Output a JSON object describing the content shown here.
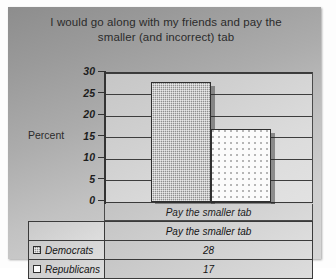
{
  "chart_data": {
    "type": "bar",
    "title": "I would go along with my friends and pay the smaller (and incorrect) tab",
    "title_line1": "I would go along with my friends and pay the",
    "title_line2": "smaller (and incorrect) tab",
    "xlabel": "",
    "ylabel": "Percent",
    "categories": [
      "Pay the smaller tab"
    ],
    "series": [
      {
        "name": "Democrats",
        "values": [
          28
        ],
        "swatch": "dem"
      },
      {
        "name": "Republicans",
        "values": [
          17
        ],
        "swatch": "rep"
      }
    ],
    "ylim": [
      0,
      30
    ],
    "yticks": [
      0,
      5,
      10,
      15,
      20,
      25,
      30
    ],
    "ytick_labels": [
      "0",
      "5",
      "10",
      "15",
      "20",
      "25",
      "30"
    ],
    "grid": true,
    "legend_position": "bottom-table",
    "colors": {
      "series_democrats": "#8f8f8f",
      "series_republicans": "#fbfbfb",
      "canvas": "#acacac",
      "plot_area": "#d4d4d4",
      "gridline": "#3d3d3d"
    }
  },
  "table": {
    "header_category": "Pay the smaller tab",
    "rows": [
      {
        "label": "Democrats",
        "value": "28"
      },
      {
        "label": "Republicans",
        "value": "17"
      }
    ]
  }
}
